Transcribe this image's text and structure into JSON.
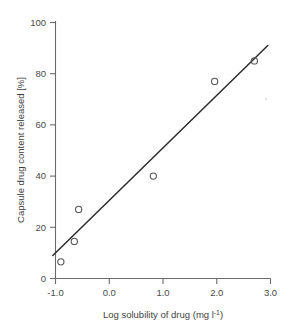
{
  "chart_data": {
    "type": "scatter",
    "title": "",
    "subtitle": "",
    "xlabel_parts": {
      "main": "Log solubility of drug (mg l",
      "exponent": "-1",
      "tail": ")"
    },
    "xlabel": "Log solubility of drug (mg l-1)",
    "ylabel": "Capsule drug content released [%]",
    "xlim": [
      -1.0,
      3.0
    ],
    "ylim": [
      0,
      100
    ],
    "xticks": [
      -1.0,
      0.0,
      1.0,
      2.0,
      3.0
    ],
    "xtick_labels": [
      "-1.0",
      "0.0",
      "1.0",
      "2.0",
      "3.0"
    ],
    "yticks": [
      0,
      20,
      40,
      60,
      80,
      100
    ],
    "ytick_labels": [
      "0",
      "20",
      "40",
      "60",
      "80",
      "100"
    ],
    "grid": false,
    "legend": null,
    "marker_style": "open-circle",
    "points": [
      {
        "x": -0.9,
        "y": 6.5
      },
      {
        "x": -0.65,
        "y": 14.5
      },
      {
        "x": -0.57,
        "y": 27.0
      },
      {
        "x": 0.82,
        "y": 40.0
      },
      {
        "x": 1.96,
        "y": 77.0
      },
      {
        "x": 2.7,
        "y": 85.0
      }
    ],
    "series": [
      {
        "name": "Capsule drug content released",
        "x": [
          -0.9,
          -0.65,
          -0.57,
          0.82,
          1.96,
          2.7
        ],
        "values": [
          6.5,
          14.5,
          27.0,
          40.0,
          77.0,
          85.0
        ]
      }
    ],
    "fit_line": {
      "name": "linear regression line",
      "x_start": -1.05,
      "y_start": 9.0,
      "x_end": 2.95,
      "y_end": 91.0
    },
    "colors": {
      "axis": "#6b6b6b",
      "line": "#2c2c2c",
      "marker": "#555555",
      "text": "#3f3f3f",
      "background": "#ffffff"
    }
  }
}
